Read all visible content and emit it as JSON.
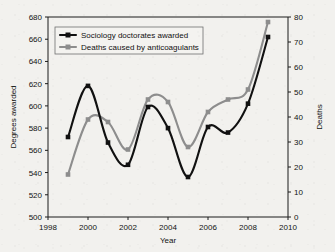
{
  "chart_data": {
    "type": "line",
    "title": "",
    "xlabel": "Year",
    "ylabel": "Degrees awarded",
    "y2label": "Deaths",
    "x": [
      1999,
      2000,
      2001,
      2002,
      2003,
      2004,
      2005,
      2006,
      2007,
      2008,
      2009
    ],
    "xlim": [
      1998,
      2010
    ],
    "xticks": [
      1998,
      2000,
      2002,
      2004,
      2006,
      2008,
      2010
    ],
    "xticklabels": [
      "1998",
      "2000",
      "2002",
      "2004",
      "2006",
      "2008",
      "2010"
    ],
    "ylim": [
      500,
      680
    ],
    "yticks": [
      500,
      520,
      540,
      560,
      580,
      600,
      620,
      640,
      660,
      680
    ],
    "yticklabels": [
      "500",
      "520",
      "540",
      "560",
      "580",
      "600",
      "620",
      "640",
      "660",
      "680"
    ],
    "y2lim": [
      0,
      80
    ],
    "y2ticks": [
      0,
      10,
      20,
      30,
      40,
      50,
      60,
      70,
      80
    ],
    "y2ticklabels": [
      "0",
      "10",
      "20",
      "30",
      "40",
      "50",
      "60",
      "70",
      "80"
    ],
    "grid": false,
    "legend_position": "top-left",
    "smoothing": "spline",
    "series": [
      {
        "name": "Sociology doctorates awarded",
        "axis": "left",
        "color": "#111111",
        "marker": "square",
        "values": [
          572,
          618,
          567,
          547,
          599,
          580,
          536,
          581,
          576,
          602,
          662
        ]
      },
      {
        "name": "Deaths caused by anticoagulants",
        "axis": "right",
        "color": "#8d8d8d",
        "marker": "square",
        "values": [
          17,
          39,
          38,
          27,
          47,
          46,
          28,
          42,
          47,
          51,
          78
        ]
      }
    ]
  }
}
